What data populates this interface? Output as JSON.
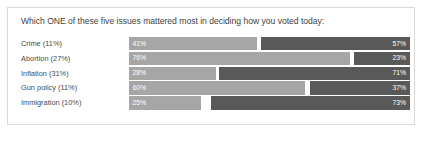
{
  "card": {
    "title": "Which ONE of these five issues mattered most in deciding how you voted today:",
    "border_color": "#d9d9d9",
    "background_color": "#ffffff"
  },
  "colors": {
    "left_segment": "#a6a6a6",
    "right_segment": "#595959",
    "title_text": "#3f3f3f",
    "label_text": "#4a4a4a",
    "value_text": "#ffffff"
  },
  "chart_data": {
    "type": "bar",
    "title": "Which ONE of these five issues mattered most in deciding how you voted today:",
    "xlabel": "",
    "ylabel": "",
    "orientation": "horizontal",
    "stacked": true,
    "grid": false,
    "legend": "none",
    "categories": [
      "Crime (11%)",
      "Abortion (27%)",
      "Inflation (31%)",
      "Gun policy (11%)",
      "Immigration (10%)"
    ],
    "series": [
      {
        "name": "left",
        "color": "#a6a6a6",
        "values": [
          41,
          76,
          28,
          60,
          25
        ],
        "labels": [
          "41%",
          "76%",
          "28%",
          "60%",
          "25%"
        ]
      },
      {
        "name": "right",
        "color": "#595959",
        "values": [
          57,
          23,
          71,
          37,
          73
        ],
        "labels": [
          "57%",
          "23%",
          "71%",
          "37%",
          "73%"
        ]
      }
    ],
    "rows": [
      {
        "label": "Crime (11%)",
        "left_value": "41%",
        "right_value": "57%",
        "left_width_pct": 45.5,
        "right_width_pct": 53.0
      },
      {
        "label": "Abortion (27%)",
        "left_value": "76%",
        "right_value": "23%",
        "left_width_pct": 78.5,
        "right_width_pct": 20.0
      },
      {
        "label": "Inflation (31%)",
        "left_value": "28%",
        "right_value": "71%",
        "left_width_pct": 31.0,
        "right_width_pct": 68.0
      },
      {
        "label": "Gun policy (11%)",
        "left_value": "60%",
        "right_value": "37%",
        "left_width_pct": 62.5,
        "right_width_pct": 35.5
      },
      {
        "label": "Immigration (10%)",
        "left_value": "25%",
        "right_value": "73%",
        "left_width_pct": 25.5,
        "right_width_pct": 71.0
      }
    ]
  }
}
